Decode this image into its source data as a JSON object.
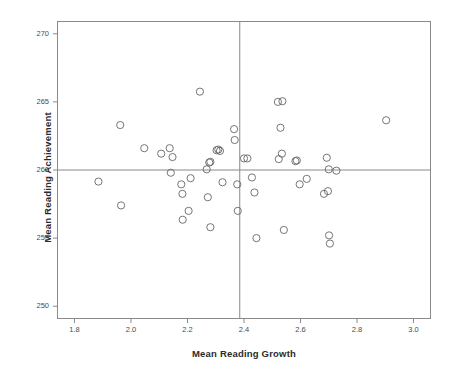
{
  "chart_data": {
    "type": "scatter",
    "title": "",
    "xlabel": "Mean Reading Growth",
    "ylabel": "Mean Reading Achievement",
    "xlim": [
      1.74,
      3.06
    ],
    "ylim": [
      249.1,
      270.9
    ],
    "xticks": [
      1.8,
      2.0,
      2.2,
      2.4,
      2.6,
      2.8,
      3.0
    ],
    "xticklabels": [
      "1.8",
      "2.0",
      "2.2",
      "2.4",
      "2.6",
      "2.8",
      "3.0"
    ],
    "yticks": [
      250,
      255,
      260,
      265,
      270
    ],
    "yticklabels": [
      "250",
      "255",
      "260",
      "265",
      "270"
    ],
    "grid": false,
    "legend": null,
    "marker": "open-circle",
    "marker_color": "#666666",
    "marker_size": 4.6,
    "reference_lines": [
      {
        "orientation": "vertical",
        "value": 2.385,
        "color": "#888888"
      },
      {
        "orientation": "horizontal",
        "value": 260.0,
        "color": "#888888"
      }
    ],
    "points": [
      {
        "x": 1.885,
        "y": 259.15
      },
      {
        "x": 1.962,
        "y": 263.3
      },
      {
        "x": 1.965,
        "y": 257.4
      },
      {
        "x": 2.047,
        "y": 261.6
      },
      {
        "x": 2.107,
        "y": 261.2
      },
      {
        "x": 2.137,
        "y": 261.6
      },
      {
        "x": 2.141,
        "y": 259.8
      },
      {
        "x": 2.147,
        "y": 260.95
      },
      {
        "x": 2.178,
        "y": 258.95
      },
      {
        "x": 2.182,
        "y": 258.25
      },
      {
        "x": 2.183,
        "y": 256.35
      },
      {
        "x": 2.204,
        "y": 257.0
      },
      {
        "x": 2.211,
        "y": 259.4
      },
      {
        "x": 2.244,
        "y": 265.75
      },
      {
        "x": 2.268,
        "y": 260.05
      },
      {
        "x": 2.272,
        "y": 258.0
      },
      {
        "x": 2.277,
        "y": 260.55
      },
      {
        "x": 2.281,
        "y": 260.6
      },
      {
        "x": 2.281,
        "y": 255.8
      },
      {
        "x": 2.303,
        "y": 261.45
      },
      {
        "x": 2.309,
        "y": 261.5
      },
      {
        "x": 2.315,
        "y": 261.4
      },
      {
        "x": 2.324,
        "y": 259.1
      },
      {
        "x": 2.365,
        "y": 263.0
      },
      {
        "x": 2.367,
        "y": 262.2
      },
      {
        "x": 2.376,
        "y": 258.95
      },
      {
        "x": 2.378,
        "y": 257.0
      },
      {
        "x": 2.4,
        "y": 260.85
      },
      {
        "x": 2.412,
        "y": 260.85
      },
      {
        "x": 2.428,
        "y": 259.45
      },
      {
        "x": 2.437,
        "y": 258.35
      },
      {
        "x": 2.444,
        "y": 255.0
      },
      {
        "x": 2.52,
        "y": 265.0
      },
      {
        "x": 2.523,
        "y": 260.8
      },
      {
        "x": 2.529,
        "y": 263.1
      },
      {
        "x": 2.534,
        "y": 261.2
      },
      {
        "x": 2.536,
        "y": 265.05
      },
      {
        "x": 2.541,
        "y": 255.6
      },
      {
        "x": 2.582,
        "y": 260.65
      },
      {
        "x": 2.587,
        "y": 260.7
      },
      {
        "x": 2.597,
        "y": 258.95
      },
      {
        "x": 2.622,
        "y": 259.35
      },
      {
        "x": 2.683,
        "y": 258.25
      },
      {
        "x": 2.693,
        "y": 260.9
      },
      {
        "x": 2.697,
        "y": 258.45
      },
      {
        "x": 2.7,
        "y": 260.05
      },
      {
        "x": 2.701,
        "y": 255.2
      },
      {
        "x": 2.704,
        "y": 254.6
      },
      {
        "x": 2.727,
        "y": 259.95
      },
      {
        "x": 2.903,
        "y": 263.65
      }
    ]
  },
  "axis": {
    "xlabel": "Mean Reading Growth",
    "ylabel": "Mean Reading Achievement",
    "xticklabels": [
      "1.8",
      "2.0",
      "2.2",
      "2.4",
      "2.6",
      "2.8",
      "3.0"
    ],
    "yticklabels": [
      "250",
      "255",
      "260",
      "265",
      "270"
    ]
  },
  "colors": {
    "background": "#ffffff",
    "frame": "#8a8a8a",
    "reference_line": "#8f8f8f",
    "marker": "#6b6b6b",
    "label_text": "#2b2b2b",
    "tick_text": "#4a4a4a"
  }
}
